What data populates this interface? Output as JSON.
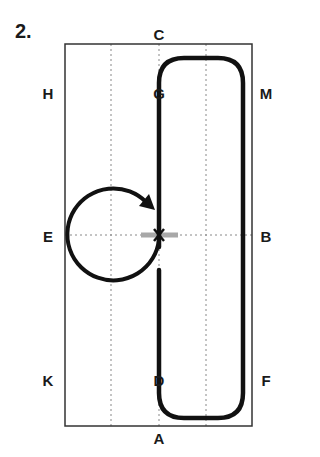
{
  "figure": {
    "number_label": "2.",
    "markers": {
      "C": {
        "label": "C",
        "x": 159,
        "y": 34
      },
      "A": {
        "label": "A",
        "x": 159,
        "y": 438
      },
      "H": {
        "label": "H",
        "x": 48,
        "y": 93
      },
      "G": {
        "label": "G",
        "x": 159,
        "y": 93
      },
      "M": {
        "label": "M",
        "x": 266,
        "y": 93
      },
      "E": {
        "label": "E",
        "x": 48,
        "y": 236
      },
      "B": {
        "label": "B",
        "x": 266,
        "y": 236
      },
      "K": {
        "label": "K",
        "x": 48,
        "y": 380
      },
      "D": {
        "label": "D",
        "x": 159,
        "y": 380
      },
      "F": {
        "label": "F",
        "x": 266,
        "y": 380
      }
    },
    "center_marker": {
      "label": "X"
    },
    "colors": {
      "track": "#111111",
      "arena_border": "#333333",
      "grid_dots": "#888888",
      "centerline_bar": "#a8a8a8"
    }
  }
}
